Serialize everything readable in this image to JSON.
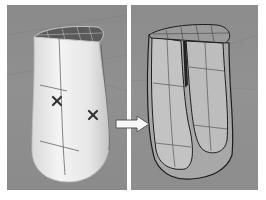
{
  "figure": {
    "left_viewport": {
      "label": "",
      "object": "smooth shaded rounded surface with gridded top cap",
      "markers": [
        {
          "symbol": "x-mark",
          "x": 50,
          "y": 96
        },
        {
          "symbol": "x-mark",
          "x": 86,
          "y": 110
        }
      ]
    },
    "right_viewport": {
      "label": "",
      "object": "surface split into separated flat-shaded wireframe pieces"
    },
    "arrow": {
      "direction": "right",
      "icon": "arrow-right-icon"
    },
    "colors": {
      "viewport_bg": "#8e8e8e",
      "surface_light": "#eeeeee",
      "surface_gray": "#bdbdbd",
      "wire": "#2a2a2a",
      "separator": "#ffffff"
    }
  }
}
